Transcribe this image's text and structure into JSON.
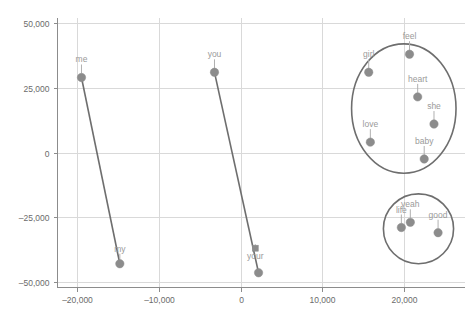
{
  "chart_data": {
    "type": "scatter",
    "title": "",
    "subtitle": "",
    "xlabel": "",
    "ylabel": "",
    "xlim": [
      -22500,
      27500
    ],
    "ylim": [
      -52000,
      52000
    ],
    "grid": true,
    "legend": null,
    "x_ticks": [
      -20000,
      -10000,
      0,
      10000,
      20000
    ],
    "x_tick_labels": [
      "–20,000",
      "–10,000",
      "0",
      "10,000",
      "20,000"
    ],
    "y_ticks": [
      -50000,
      -25000,
      0,
      25000,
      50000
    ],
    "y_tick_labels": [
      "–50,000",
      "–25,000",
      "0",
      "25,000",
      "50,000"
    ],
    "marker_color": "#8c8c8c",
    "label_color": "#9a9a9a",
    "connector_color": "#6e6e6e",
    "grid_color": "#d9d9d9",
    "axis_color": "#8c8c8c",
    "points": [
      {
        "label": "me",
        "x": -19500,
        "y": 29000,
        "marker": "circle",
        "label_dx": 0,
        "label_dy": -15
      },
      {
        "label": "my",
        "x": -14800,
        "y": -43000,
        "marker": "circle",
        "label_dx": 0,
        "label_dy": -12
      },
      {
        "label": "you",
        "x": -3200,
        "y": 31000,
        "marker": "circle",
        "label_dx": 0,
        "label_dy": -15
      },
      {
        "label": "your",
        "x": 1800,
        "y": -37000,
        "marker": "square",
        "label_dx": 0,
        "label_dy": 11
      },
      {
        "label": "",
        "x": 2200,
        "y": -46500,
        "marker": "circle",
        "label_dx": 0,
        "label_dy": 0
      },
      {
        "label": "girl",
        "x": 15700,
        "y": 31000,
        "marker": "circle",
        "label_dx": 0,
        "label_dy": -15
      },
      {
        "label": "feel",
        "x": 20700,
        "y": 38000,
        "marker": "circle",
        "label_dx": 0,
        "label_dy": -15
      },
      {
        "label": "heart",
        "x": 21700,
        "y": 21500,
        "marker": "circle",
        "label_dx": 0,
        "label_dy": -15
      },
      {
        "label": "she",
        "x": 23700,
        "y": 11000,
        "marker": "circle",
        "label_dx": 0,
        "label_dy": -15
      },
      {
        "label": "love",
        "x": 15900,
        "y": 4000,
        "marker": "circle",
        "label_dx": 0,
        "label_dy": -15
      },
      {
        "label": "baby",
        "x": 22500,
        "y": -2500,
        "marker": "circle",
        "label_dx": 0,
        "label_dy": -15
      },
      {
        "label": "life",
        "x": 19700,
        "y": -29000,
        "marker": "circle",
        "label_dx": 0,
        "label_dy": -15
      },
      {
        "label": "yeah",
        "x": 20800,
        "y": -27000,
        "marker": "circle",
        "label_dx": 0,
        "label_dy": -15
      },
      {
        "label": "good",
        "x": 24200,
        "y": -31000,
        "marker": "circle",
        "label_dx": 0,
        "label_dy": -15
      }
    ],
    "connectors": [
      {
        "from": "me",
        "to": "my",
        "from_x": -19500,
        "from_y": 29000,
        "to_x": -14800,
        "to_y": -43000
      },
      {
        "from": "you",
        "to": "your",
        "from_x": -3200,
        "from_y": 31000,
        "to_x": 2200,
        "to_y": -46500
      }
    ],
    "annotations": [
      {
        "name": "upper-cluster-ring",
        "shape": "ellipse",
        "cx": 20000,
        "cy": 17000,
        "rx": 6400,
        "ry": 25000
      },
      {
        "name": "lower-cluster-ring",
        "shape": "ellipse",
        "cx": 21800,
        "cy": -29500,
        "rx": 4300,
        "ry": 13500
      }
    ]
  }
}
